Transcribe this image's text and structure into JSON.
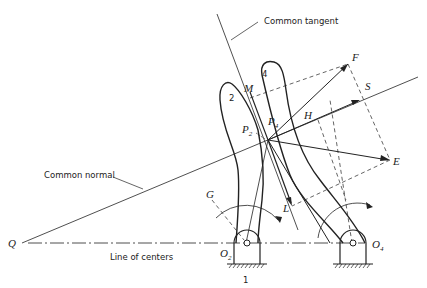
{
  "diagram": {
    "captions": {
      "common_tangent": "Common tangent",
      "common_normal": "Common normal",
      "line_of_centers": "Line of centers"
    },
    "points": {
      "Q": "Q",
      "O2": "O",
      "O2_sub": "2",
      "O4": "O",
      "O4_sub": "4",
      "P2": "P",
      "P2_sub": "2",
      "P4": "P",
      "P4_sub": "4",
      "M": "M",
      "F": "F",
      "S": "S",
      "H": "H",
      "E": "E",
      "G": "G",
      "L": "L"
    },
    "links": {
      "link1": "1",
      "link2": "2",
      "link4": "4"
    }
  }
}
